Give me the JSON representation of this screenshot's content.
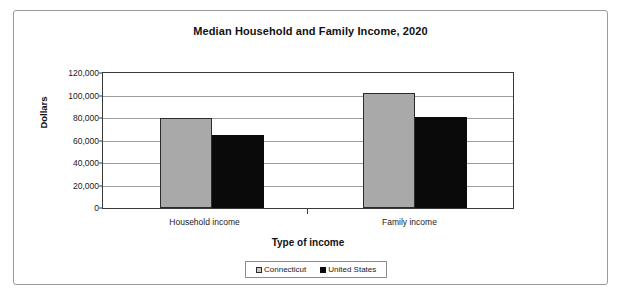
{
  "chart_data": {
    "type": "bar",
    "title": "Median Household and Family Income, 2020",
    "xlabel": "Type of income",
    "ylabel": "Dollars",
    "categories": [
      "Household income",
      "Family income"
    ],
    "series": [
      {
        "name": "Connecticut",
        "values": [
          80000,
          102000
        ],
        "color": "#a9a9a9"
      },
      {
        "name": "United States",
        "values": [
          65000,
          81000
        ],
        "color": "#0a0a0a"
      }
    ],
    "ylim": [
      0,
      120000
    ],
    "yticks": [
      "0",
      "20,000",
      "40,000",
      "60,000",
      "80,000",
      "100,000",
      "120,000"
    ],
    "ytick_values": [
      0,
      20000,
      40000,
      60000,
      80000,
      100000,
      120000
    ],
    "grid": true,
    "legend_position": "bottom"
  }
}
